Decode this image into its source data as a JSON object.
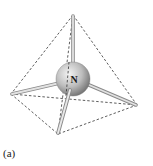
{
  "figure": {
    "caption": "(a)",
    "central_atom": {
      "label": "N",
      "center": [
        73,
        79
      ],
      "radius": 17
    },
    "vertices": {
      "top": [
        73,
        15
      ],
      "left": [
        11,
        94
      ],
      "right": [
        137,
        105
      ],
      "bottom": [
        58,
        134
      ]
    },
    "colors": {
      "edge_dashed": "#333333",
      "bond": "#b8b8b8",
      "sphere_light": "#e8e8e8",
      "sphere_dark": "#7a7a7a"
    }
  }
}
